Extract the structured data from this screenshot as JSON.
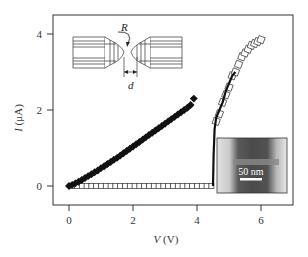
{
  "chart_data": {
    "type": "scatter",
    "title": "",
    "xlabel": "V (V)",
    "ylabel": "I (μA)",
    "xlim": [
      -0.5,
      7.0
    ],
    "ylim": [
      -0.5,
      4.5
    ],
    "grid": false,
    "legend": null,
    "x_ticks": [
      0,
      2,
      4,
      6
    ],
    "x_tick_labels": [
      "0",
      "2",
      "4",
      "6"
    ],
    "y_ticks": [
      0,
      2,
      4
    ],
    "y_tick_labels": [
      "0",
      "2",
      "4"
    ],
    "series": [
      {
        "name": "filled squares",
        "marker": "filled-square",
        "x": [
          0.0,
          0.1,
          0.2,
          0.3,
          0.4,
          0.5,
          0.6,
          0.7,
          0.8,
          0.9,
          1.0,
          1.1,
          1.2,
          1.3,
          1.4,
          1.5,
          1.6,
          1.7,
          1.8,
          1.9,
          2.0,
          2.1,
          2.2,
          2.3,
          2.4,
          2.5,
          2.6,
          2.7,
          2.8,
          2.9,
          3.0,
          3.1,
          3.2,
          3.3,
          3.4,
          3.5,
          3.6,
          3.7,
          3.8,
          3.9
        ],
        "y": [
          0.0,
          0.03,
          0.07,
          0.11,
          0.16,
          0.21,
          0.26,
          0.31,
          0.36,
          0.41,
          0.47,
          0.52,
          0.58,
          0.63,
          0.69,
          0.74,
          0.8,
          0.86,
          0.92,
          0.98,
          1.04,
          1.1,
          1.16,
          1.22,
          1.28,
          1.34,
          1.4,
          1.46,
          1.52,
          1.58,
          1.64,
          1.7,
          1.76,
          1.82,
          1.88,
          1.94,
          2.0,
          2.06,
          2.13,
          2.3
        ]
      },
      {
        "name": "open squares",
        "marker": "open-square",
        "x": [
          0.1,
          0.25,
          0.4,
          0.55,
          0.7,
          0.85,
          1.0,
          1.15,
          1.3,
          1.45,
          1.6,
          1.75,
          1.9,
          2.05,
          2.2,
          2.35,
          2.5,
          2.65,
          2.8,
          2.95,
          3.1,
          3.25,
          3.4,
          3.55,
          3.7,
          3.85,
          4.0,
          4.15,
          4.3,
          4.45,
          4.6,
          4.7,
          4.8,
          4.9,
          5.0,
          5.1,
          5.2,
          5.3,
          5.4,
          5.5,
          5.6,
          5.7,
          5.8,
          5.9,
          6.0
        ],
        "y": [
          0,
          0,
          0,
          0,
          0,
          0,
          0,
          0,
          0,
          0,
          0,
          0,
          0,
          0,
          0,
          0,
          0,
          0,
          0,
          0,
          0,
          0,
          0,
          0,
          0,
          0,
          0,
          0,
          0,
          0,
          1.7,
          1.9,
          2.2,
          2.4,
          2.6,
          2.9,
          3.0,
          3.2,
          3.4,
          3.5,
          3.6,
          3.7,
          3.75,
          3.8,
          3.85
        ]
      },
      {
        "name": "trace line",
        "marker": "line",
        "x": [
          4.5,
          4.52,
          4.55,
          4.6,
          4.7,
          4.8,
          4.9,
          5.0,
          5.1,
          5.2
        ],
        "y": [
          0.0,
          0.8,
          1.5,
          1.8,
          2.0,
          2.2,
          2.5,
          2.7,
          2.9,
          3.0
        ]
      }
    ],
    "annotations": [
      {
        "type": "schematic-inset",
        "labels": [
          "R",
          "d"
        ],
        "description": "two opposing tapered electrodes with tip radius R separated by gap d"
      },
      {
        "type": "micrograph-inset",
        "scale_bar": "50 nm"
      }
    ]
  },
  "labels": {
    "x_axis": "V (V)",
    "y_axis": "I (μA)",
    "y_axis_symbol": "I",
    "y_axis_unit": " (μA)",
    "x_axis_symbol": "V",
    "x_axis_unit": " (V)",
    "x_ticks": [
      "0",
      "2",
      "4",
      "6"
    ],
    "y_ticks": [
      "0",
      "2",
      "4"
    ],
    "inset_R": "R",
    "inset_d": "d",
    "scale_bar": "50 nm"
  },
  "colors": {
    "frame": "#333333",
    "marker_fill": "#111111",
    "marker_open_fill": "#ffffff",
    "micrograph_dark": "#555555",
    "micrograph_light": "#e6e6e6"
  }
}
